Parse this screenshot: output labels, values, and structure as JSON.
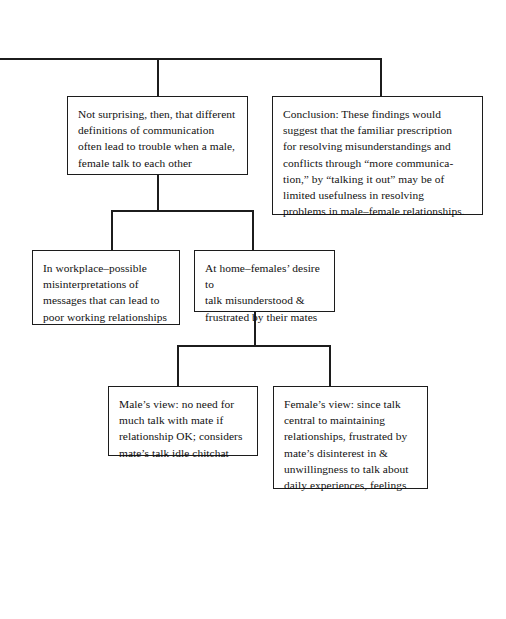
{
  "diagram": {
    "background_color": "#ffffff",
    "line_color": "#1c1c1c",
    "text_color": "#111111",
    "nodes": [
      {
        "id": "premise",
        "name": "node-premise",
        "text": "Not surprising, then, that different\ndefinitions of communication\noften lead to trouble when a male,\nfemale talk to each other",
        "x": 67,
        "y": 96,
        "width": 181,
        "height": 79
      },
      {
        "id": "conclusion",
        "name": "node-conclusion",
        "text": "Conclusion:  These findings would\nsuggest that the familiar prescription\nfor resolving misunderstandings and\nconflicts through “more communica-\ntion,” by “talking it out” may be of\nlimited usefulness in resolving\nproblems in male–female relationships.",
        "x": 272,
        "y": 96,
        "width": 211,
        "height": 119
      },
      {
        "id": "workplace",
        "name": "node-workplace",
        "text": "In workplace–possible\nmisinterpretations of\nmessages that can lead to\npoor working relationships",
        "x": 32,
        "y": 250,
        "width": 148,
        "height": 75
      },
      {
        "id": "home",
        "name": "node-home",
        "text": "At home–females’ desire to\ntalk misunderstood &\nfrustrated by their mates",
        "x": 194,
        "y": 250,
        "width": 141,
        "height": 62
      },
      {
        "id": "male-view",
        "name": "node-male-view",
        "text": "Male’s view:  no need for\nmuch talk with mate if\nrelationship OK; considers\nmate’s talk idle chitchat",
        "x": 108,
        "y": 386,
        "width": 150,
        "height": 70
      },
      {
        "id": "female-view",
        "name": "node-female-view",
        "text": "Female’s view:  since talk\ncentral to maintaining\nrelationships, frustrated by\nmate’s disinterest in &\nunwillingness to talk about\ndaily experiences, feelings",
        "x": 273,
        "y": 386,
        "width": 155,
        "height": 103
      }
    ],
    "connectors": [
      {
        "name": "connector-top-spine",
        "orientation": "horizontal",
        "x": 0,
        "y": 58,
        "length": 382,
        "thickness": 1.6
      },
      {
        "name": "connector-top-to-premise",
        "orientation": "vertical",
        "x": 157,
        "y": 58,
        "length": 38,
        "thickness": 1.6
      },
      {
        "name": "connector-top-to-conclusion",
        "orientation": "vertical",
        "x": 380,
        "y": 58,
        "length": 38,
        "thickness": 1.6
      },
      {
        "name": "connector-premise-down",
        "orientation": "vertical",
        "x": 157,
        "y": 175,
        "length": 36,
        "thickness": 1.6
      },
      {
        "name": "connector-row2-spine",
        "orientation": "horizontal",
        "x": 111,
        "y": 210,
        "length": 142,
        "thickness": 1.6
      },
      {
        "name": "connector-to-workplace",
        "orientation": "vertical",
        "x": 111,
        "y": 210,
        "length": 41,
        "thickness": 1.6
      },
      {
        "name": "connector-to-home",
        "orientation": "vertical",
        "x": 252,
        "y": 210,
        "length": 41,
        "thickness": 1.6
      },
      {
        "name": "connector-home-down",
        "orientation": "vertical",
        "x": 254,
        "y": 312,
        "length": 34,
        "thickness": 1.6
      },
      {
        "name": "connector-row3-spine",
        "orientation": "horizontal",
        "x": 177,
        "y": 345,
        "length": 154,
        "thickness": 1.6
      },
      {
        "name": "connector-to-male-view",
        "orientation": "vertical",
        "x": 177,
        "y": 345,
        "length": 42,
        "thickness": 1.6
      },
      {
        "name": "connector-to-female-view",
        "orientation": "vertical",
        "x": 329,
        "y": 345,
        "length": 42,
        "thickness": 1.6
      }
    ]
  }
}
